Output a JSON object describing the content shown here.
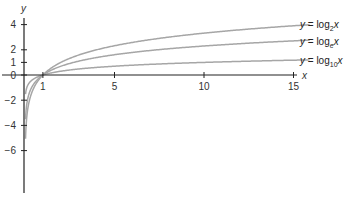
{
  "chart_data": {
    "type": "line",
    "title": "",
    "xlabel": "x",
    "ylabel": "y",
    "xlim": [
      0,
      15
    ],
    "ylim": [
      -7,
      5
    ],
    "grid": false,
    "x_ticks": [
      "1",
      "5",
      "10",
      "15"
    ],
    "y_ticks": [
      "4",
      "2",
      "1",
      "0",
      "−2",
      "−4",
      "−6"
    ],
    "x": [
      0.05,
      0.1,
      0.2,
      0.3,
      0.5,
      0.75,
      1,
      1.5,
      2,
      3,
      4,
      5,
      6,
      8,
      10,
      12,
      14,
      15.9
    ],
    "series": [
      {
        "name": "y = log2x",
        "label_base": "2",
        "values": [
          -4.32,
          -3.32,
          -2.32,
          -1.74,
          -1.0,
          -0.42,
          0,
          0.58,
          1.0,
          1.58,
          2.0,
          2.32,
          2.58,
          3.0,
          3.32,
          3.58,
          3.81,
          3.99
        ]
      },
      {
        "name": "y = logex",
        "label_base": "e",
        "values": [
          -3.0,
          -2.3,
          -1.61,
          -1.2,
          -0.69,
          -0.29,
          0,
          0.41,
          0.69,
          1.1,
          1.39,
          1.61,
          1.79,
          2.08,
          2.3,
          2.48,
          2.64,
          2.77
        ]
      },
      {
        "name": "y = log10x",
        "label_base": "10",
        "values": [
          -1.3,
          -1.0,
          -0.7,
          -0.52,
          -0.3,
          -0.12,
          0,
          0.18,
          0.3,
          0.48,
          0.6,
          0.7,
          0.78,
          0.9,
          1.0,
          1.08,
          1.15,
          1.2
        ]
      }
    ],
    "legend_position": "right, inline at curve ends",
    "line_color": "#a6a6a6",
    "axis_color": "#222222"
  },
  "labels": {
    "x_axis": "x",
    "y_axis": "y",
    "legend": [
      {
        "prefix": "y = log",
        "base": "2",
        "var": "x"
      },
      {
        "prefix": "y = log",
        "base": "e",
        "var": "x"
      },
      {
        "prefix": "y = log",
        "base": "10",
        "var": "x"
      }
    ]
  }
}
